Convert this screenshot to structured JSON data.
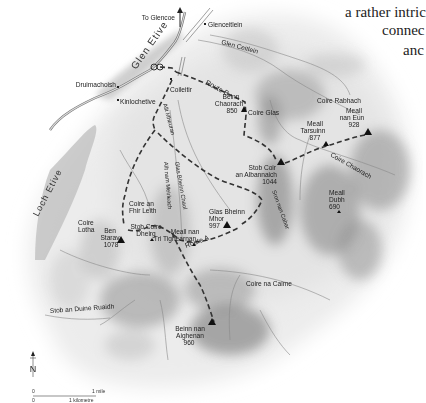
{
  "caption": {
    "lines": [
      "a rather intric",
      "connec",
      "anc"
    ]
  },
  "map": {
    "glen_label": "Glen Etive",
    "loch_label": "Loch Etive",
    "direction_label": "To Glencoe",
    "settlements": [
      {
        "name": "Glenceitlein"
      },
      {
        "name": "Druimachoish"
      },
      {
        "name": "Kinlochetive"
      },
      {
        "name": "Coileitir"
      }
    ],
    "valleys": [
      {
        "name": "Glen Ceitlein"
      },
      {
        "name": "Coire Glas"
      },
      {
        "name": "Coire Rabhach"
      },
      {
        "name": "Coire Chaorach"
      },
      {
        "name": "Coire an Fhir Leith"
      },
      {
        "name": "Coire Lotha"
      },
      {
        "name": "Coire na Caime"
      },
      {
        "name": "Allt Mheuran"
      },
      {
        "name": "Allt nam Meirleach"
      },
      {
        "name": "Glas Bheinn Chaol"
      },
      {
        "name": "Sron nan Cabar"
      },
      {
        "name": "Stob an Duine Ruaidh"
      }
    ],
    "peaks": [
      {
        "name_l1": "Beinn",
        "name_l2": "Chaorach",
        "height": "850"
      },
      {
        "name_l1": "Meall",
        "name_l2": "nan Eun",
        "height": "928"
      },
      {
        "name_l1": "Meall",
        "name_l2": "Tarsuinn",
        "height": "877"
      },
      {
        "name_l1": "Stob Coir",
        "name_l2": "an Albannaich",
        "height": "1044"
      },
      {
        "name_l1": "Meall",
        "name_l2": "Dubh",
        "height": "690"
      },
      {
        "name_l1": "Glas Bheinn",
        "name_l2": "Mhor",
        "height": "997"
      },
      {
        "name_l1": "Ben",
        "name_l2": "Starav",
        "height": "1078"
      },
      {
        "name_l1": "Stob Coire",
        "name_l2": "Dheirg",
        "height": ""
      },
      {
        "name_l1": "Meall nan",
        "name_l2": "Tri Tighearnan",
        "height": ""
      },
      {
        "name_l1": "Beinn nan",
        "name_l2": "Aighenan",
        "height": "960"
      }
    ],
    "routes": [
      {
        "label": "Route B"
      },
      {
        "label": "Route A"
      }
    ],
    "compass": {
      "label": "N"
    },
    "scale": {
      "zero_top": "0",
      "miles": "1 mile",
      "zero_bottom": "0",
      "km": "1 kilometre"
    }
  }
}
